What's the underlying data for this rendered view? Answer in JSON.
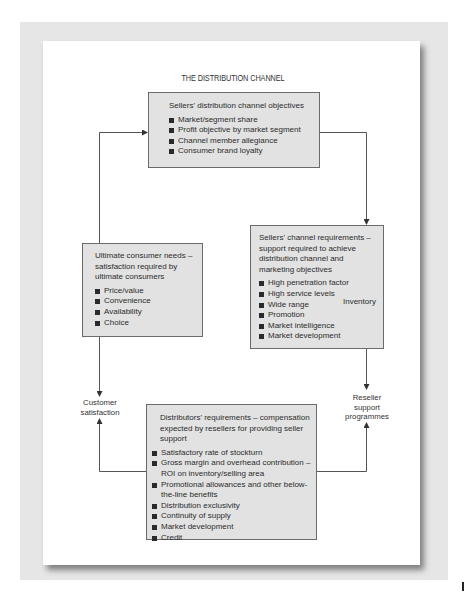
{
  "title": "THE DISTRIBUTION CHANNEL",
  "boxes": {
    "sellers_objectives": {
      "heading": "Sellers' distribution channel objectives",
      "items": [
        "Market/segment share",
        "Profit objective by market segment",
        "Channel member allegiance",
        "Consumer brand loyalty"
      ]
    },
    "sellers_requirements": {
      "heading": "Sellers' channel requirements – support required to achieve distribution channel and marketing objectives",
      "items": [
        "High penetration factor",
        "High service levels",
        "Wide range",
        "Promotion",
        "Market intelligence",
        "Market development"
      ],
      "brace_label": "Inventory"
    },
    "consumer_needs": {
      "heading": "Ultimate consumer needs – satisfaction required by ultimate consumers",
      "items": [
        "Price/value",
        "Convenience",
        "Availability",
        "Choice"
      ]
    },
    "distributors_requirements": {
      "heading": "Distributors' requirements – compensation expected by resellers for providing seller support",
      "items": [
        "Satisfactory rate of stockturn",
        "Gross margin and overhead contribution – ROI on inventory/selling area",
        "Promotional allowances and other below-the-line benefits",
        "Distribution exclusivity",
        "Continuity of supply",
        "Market development",
        "Credit"
      ]
    }
  },
  "labels": {
    "customer_satisfaction": "Customer satisfaction",
    "reseller_support": "Reseller support programmes"
  },
  "colors": {
    "box_fill": "#e2e2e2",
    "box_border": "#6b6b6b",
    "frame": "#e6e6e6",
    "line": "#555555"
  }
}
